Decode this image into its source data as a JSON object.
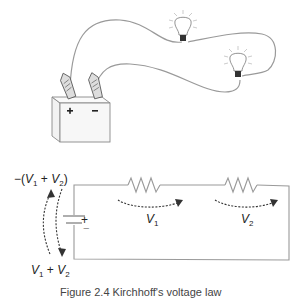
{
  "figure": {
    "pictorial": {
      "battery": {
        "plus_label": "+",
        "minus_label": "−"
      },
      "bulbs": [
        {
          "id": "bulb-1"
        },
        {
          "id": "bulb-2"
        }
      ]
    },
    "schematic": {
      "source": {
        "plus_label": "+",
        "minus_label": "−",
        "top_label_prefix": "−(",
        "top_label_v1": "V",
        "top_label_sub1": "1",
        "top_label_plus": " + ",
        "top_label_v2": "V",
        "top_label_sub2": "2",
        "top_label_suffix": ")",
        "bottom_label_v1": "V",
        "bottom_label_sub1": "1",
        "bottom_label_plus": " + ",
        "bottom_label_v2": "V",
        "bottom_label_sub2": "2"
      },
      "resistors": [
        {
          "label": "V",
          "sub": "1"
        },
        {
          "label": "V",
          "sub": "2"
        }
      ]
    },
    "caption": "Figure 2.4   Kirchhoff's voltage law"
  },
  "colors": {
    "line": "#9a9a9a",
    "dark": "#222222",
    "bulb_base": "#333333"
  }
}
